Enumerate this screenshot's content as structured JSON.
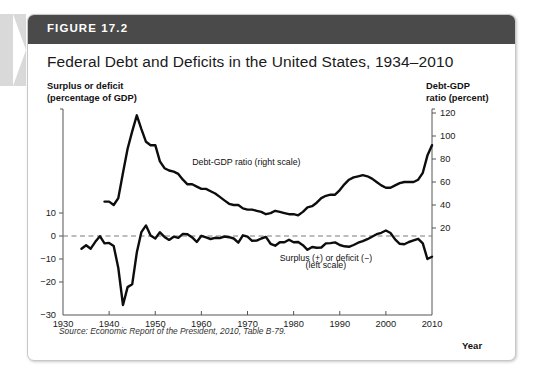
{
  "figure": {
    "number": "FIGURE 17.2",
    "title": "Federal Debt and Deficits in the United States, 1934–2010",
    "source": "Source: Economic Report of the President, 2010, Table B-79.",
    "left_axis_caption_line1": "Surplus or deficit",
    "left_axis_caption_line2": "(percentage of GDP)",
    "right_axis_caption_line1": "Debt-GDP",
    "right_axis_caption_line2": "ratio (percent)",
    "x_axis_label": "Year",
    "header_color": "#4a4a4a",
    "line_color": "#0d0d0d",
    "zero_line_color": "#7a7a7a"
  },
  "chart_data": {
    "type": "line",
    "title": "Federal Debt and Deficits in the United States, 1934–2010",
    "xlabel": "Year",
    "ylabel": "Surplus or deficit (percentage of GDP)",
    "y2label": "Debt-GDP ratio (percent)",
    "xlim": [
      1930,
      2010
    ],
    "ylim": [
      -30,
      20
    ],
    "y2lim": [
      0,
      120
    ],
    "xticks": [
      1930,
      1940,
      1950,
      1960,
      1970,
      1980,
      1990,
      2000,
      2010
    ],
    "xticklabels": [
      "1930",
      "1940",
      "1950",
      "1960",
      "1970",
      "1980",
      "1990",
      "2000",
      "2010"
    ],
    "yticks": [
      10,
      0,
      -10,
      -20,
      -30
    ],
    "yticklabels": [
      "10",
      "0",
      "−10",
      "−20",
      "−30"
    ],
    "y2ticks": [
      120,
      100,
      80,
      60,
      40,
      20
    ],
    "y2ticklabels": [
      "120",
      "100",
      "80",
      "60",
      "40",
      "20"
    ],
    "grid": false,
    "zero_reference_line": 0,
    "annotations": [
      {
        "text": "Debt-GDP ratio (right scale)",
        "x": 1958,
        "y2": 75
      },
      {
        "text": "Surplus (+) or deficit (−)",
        "x": 1987,
        "y": -11
      },
      {
        "text": "(left scale)",
        "x": 1987,
        "y": -14
      }
    ],
    "series": [
      {
        "name": "Debt-GDP ratio (right scale)",
        "axis": "right",
        "x": [
          1939,
          1940,
          1941,
          1942,
          1943,
          1944,
          1945,
          1946,
          1947,
          1948,
          1949,
          1950,
          1951,
          1952,
          1953,
          1954,
          1955,
          1956,
          1957,
          1958,
          1959,
          1960,
          1961,
          1962,
          1963,
          1964,
          1965,
          1966,
          1967,
          1968,
          1969,
          1970,
          1971,
          1972,
          1973,
          1974,
          1975,
          1976,
          1977,
          1978,
          1979,
          1980,
          1981,
          1982,
          1983,
          1984,
          1985,
          1986,
          1987,
          1988,
          1989,
          1990,
          1991,
          1992,
          1993,
          1994,
          1995,
          1996,
          1997,
          1998,
          1999,
          2000,
          2001,
          2002,
          2003,
          2004,
          2005,
          2006,
          2007,
          2008,
          2009,
          2010
        ],
        "values": [
          43,
          43,
          40,
          46,
          68,
          89,
          104,
          118,
          106,
          95,
          92,
          92,
          78,
          72,
          70,
          69,
          67,
          62,
          58,
          58,
          56,
          54,
          54,
          52,
          50,
          47,
          44,
          41,
          40,
          40,
          37,
          36,
          36,
          35,
          34,
          32,
          33,
          35,
          34,
          33,
          32,
          32,
          31,
          34,
          38,
          39,
          42,
          46,
          48,
          49,
          49,
          53,
          58,
          62,
          64,
          65,
          66,
          65,
          63,
          60,
          57,
          55,
          55,
          57,
          59,
          60,
          60,
          60,
          62,
          68,
          83,
          92
        ]
      },
      {
        "name": "Surplus (+) or deficit (−) (left scale)",
        "axis": "left",
        "x": [
          1934,
          1935,
          1936,
          1937,
          1938,
          1939,
          1940,
          1941,
          1942,
          1943,
          1944,
          1945,
          1946,
          1947,
          1948,
          1949,
          1950,
          1951,
          1952,
          1953,
          1954,
          1955,
          1956,
          1957,
          1958,
          1959,
          1960,
          1961,
          1962,
          1963,
          1964,
          1965,
          1966,
          1967,
          1968,
          1969,
          1970,
          1971,
          1972,
          1973,
          1974,
          1975,
          1976,
          1977,
          1978,
          1979,
          1980,
          1981,
          1982,
          1983,
          1984,
          1985,
          1986,
          1987,
          1988,
          1989,
          1990,
          1991,
          1992,
          1993,
          1994,
          1995,
          1996,
          1997,
          1998,
          1999,
          2000,
          2001,
          2002,
          2003,
          2004,
          2005,
          2006,
          2007,
          2008,
          2009,
          2010
        ],
        "values": [
          -5.5,
          -4.0,
          -5.5,
          -2.5,
          -0.1,
          -3.2,
          -3.0,
          -4.3,
          -13.9,
          -30.0,
          -22.2,
          -21.0,
          -7.2,
          1.7,
          4.6,
          0.2,
          -1.1,
          1.6,
          -0.4,
          -1.7,
          -0.3,
          -0.8,
          0.9,
          0.8,
          -0.6,
          -2.6,
          0.1,
          -0.6,
          -1.3,
          -0.8,
          -0.9,
          -0.2,
          -0.5,
          -1.1,
          -2.9,
          0.3,
          -0.3,
          -2.1,
          -2.0,
          -1.1,
          -0.4,
          -3.4,
          -4.2,
          -2.7,
          -2.7,
          -1.6,
          -2.7,
          -2.6,
          -4.0,
          -6.0,
          -4.8,
          -5.1,
          -5.0,
          -3.2,
          -3.1,
          -2.8,
          -3.9,
          -4.5,
          -4.7,
          -3.9,
          -2.9,
          -2.2,
          -1.4,
          -0.3,
          0.8,
          1.4,
          2.4,
          1.3,
          -1.5,
          -3.4,
          -3.6,
          -2.6,
          -1.9,
          -1.2,
          -3.2,
          -10.0,
          -9.0
        ]
      }
    ]
  }
}
